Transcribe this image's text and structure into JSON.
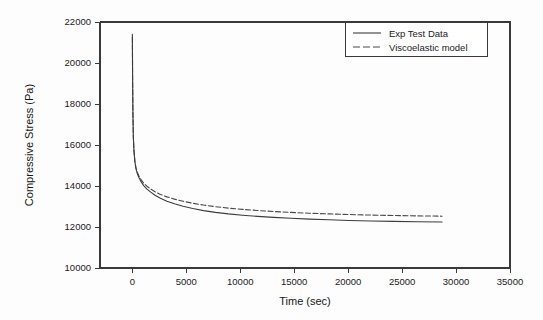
{
  "chart_data": {
    "type": "line",
    "title": "",
    "xlabel": "Time (sec)",
    "ylabel": "Compressive Stress (Pa)",
    "xlim": [
      -3000,
      35000
    ],
    "ylim": [
      10000,
      22000
    ],
    "xticks": [
      0,
      5000,
      10000,
      15000,
      20000,
      25000,
      30000,
      35000
    ],
    "xtick_labels": [
      "0",
      "5000",
      "10000",
      "15000",
      "20000",
      "25000",
      "30000",
      "35000"
    ],
    "yticks": [
      10000,
      12000,
      14000,
      16000,
      18000,
      20000,
      22000
    ],
    "ytick_labels": [
      "10000",
      "12000",
      "14000",
      "16000",
      "18000",
      "20000",
      "22000"
    ],
    "grid": false,
    "legend_position": "top-right",
    "series": [
      {
        "name": "Exp Test Data",
        "style": "solid",
        "color": "#3c3c3c",
        "x": [
          0,
          20,
          50,
          90,
          150,
          230,
          330,
          460,
          620,
          820,
          1050,
          1350,
          1700,
          2100,
          2600,
          3200,
          3900,
          4700,
          5600,
          6600,
          7700,
          8900,
          10200,
          11600,
          13100,
          14700,
          16400,
          18200,
          20100,
          22100,
          24200,
          26400,
          28700
        ],
        "y": [
          21400,
          19500,
          17600,
          16400,
          15700,
          15200,
          14850,
          14600,
          14400,
          14200,
          14020,
          13850,
          13700,
          13550,
          13400,
          13260,
          13130,
          13010,
          12900,
          12800,
          12715,
          12640,
          12575,
          12520,
          12470,
          12425,
          12385,
          12350,
          12320,
          12295,
          12275,
          12258,
          12245
        ]
      },
      {
        "name": "Viscoelastic model",
        "style": "dashed",
        "color": "#4a4a4a",
        "x": [
          0,
          20,
          50,
          90,
          150,
          230,
          330,
          460,
          620,
          820,
          1050,
          1350,
          1700,
          2100,
          2600,
          3200,
          3900,
          4700,
          5600,
          6600,
          7700,
          8900,
          10200,
          11600,
          13100,
          14700,
          16400,
          18200,
          20100,
          22100,
          24200,
          26400,
          28700
        ],
        "y": [
          21250,
          19400,
          17550,
          16380,
          15700,
          15230,
          14900,
          14670,
          14480,
          14300,
          14140,
          13990,
          13850,
          13720,
          13590,
          13470,
          13360,
          13255,
          13160,
          13070,
          12990,
          12920,
          12860,
          12805,
          12755,
          12712,
          12672,
          12638,
          12608,
          12582,
          12560,
          12542,
          12528
        ]
      }
    ]
  },
  "legend": {
    "entries": [
      {
        "label": "Exp Test Data",
        "style": "solid"
      },
      {
        "label": "Viscoelastic model",
        "style": "dashed"
      }
    ]
  }
}
